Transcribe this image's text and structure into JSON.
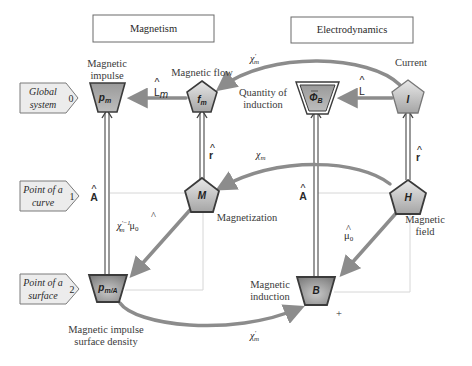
{
  "headers": {
    "magnetism": "Magnetism",
    "electrodynamics": "Electrodynamics"
  },
  "levels": [
    {
      "line1": "Global",
      "line2": "system",
      "index": "0"
    },
    {
      "line1": "Point of a",
      "line2": "curve",
      "index": "1"
    },
    {
      "line1": "Point of a",
      "line2": "surface",
      "index": "2"
    }
  ],
  "nodes": {
    "p_m": {
      "symbol": "p",
      "sub": "m",
      "label1": "Magnetic",
      "label2": "impulse",
      "shape": "trapezoid"
    },
    "f_m": {
      "symbol": "f",
      "sub": "m",
      "label1": "Magnetic flow",
      "shape": "pentagon"
    },
    "phi_B": {
      "symbol": "Φ",
      "sub": "B",
      "label1": "Quantity of",
      "label2": "induction",
      "shape": "trapezoid-double"
    },
    "I": {
      "symbol": "I",
      "label1": "Current",
      "shape": "pentagon"
    },
    "M": {
      "symbol": "M",
      "label1": "Magnetization",
      "shape": "pentagon"
    },
    "H": {
      "symbol": "H",
      "label1": "Magnetic",
      "label2": "field",
      "shape": "pentagon"
    },
    "p_mA": {
      "symbol": "p",
      "sub": "m/A",
      "label1": "Magnetic impulse",
      "label2": "surface density",
      "shape": "trapezoid"
    },
    "B": {
      "symbol": "B",
      "label1": "Magnetic",
      "label2": "induction",
      "shape": "trapezoid"
    }
  },
  "operators": {
    "L_m": {
      "text": "L",
      "sub": "m",
      "hat": "^"
    },
    "L": {
      "text": "L",
      "hat": "^"
    },
    "chi_m_prime_top": {
      "text": "χ",
      "sup": "'",
      "sub": "m"
    },
    "chi_m": {
      "text": "χ",
      "sub": "m"
    },
    "r_left": {
      "text": "r",
      "hat": "^"
    },
    "r_right": {
      "text": "r",
      "hat": "^"
    },
    "A_left": {
      "text": "A",
      "hat": "^"
    },
    "A_right": {
      "text": "A",
      "hat": "^"
    },
    "chi_mu_left": {
      "text": "χ",
      "sup": "'−1",
      "sub": "m",
      "tail": "μ",
      "tail_sub": "0",
      "tail_hat": "^"
    },
    "mu_0": {
      "text": "μ",
      "sub": "0",
      "hat": "^"
    },
    "chi_m_prime_bottom": {
      "text": "χ",
      "sup": "'",
      "sub": "m"
    },
    "plus": "+"
  },
  "colors": {
    "node_fill_light": "#d9d9d9",
    "node_fill_dark": "#8a8a8a",
    "node_stroke": "#3b3b3b",
    "arrow": "#8c8c8c",
    "double_line": "#555555",
    "grid_line": "#d8d8d8",
    "tag_fill": "#ededed",
    "tag_stroke": "#7a7a7a"
  }
}
